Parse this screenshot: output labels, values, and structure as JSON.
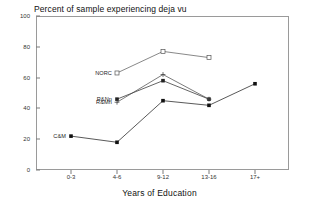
{
  "chart_data": {
    "type": "line",
    "title": "Percent of sample experiencing deja vu",
    "xlabel": "Years of Education",
    "ylabel": "",
    "categories": [
      "0-3",
      "4-6",
      "9-12",
      "13-16",
      "17+"
    ],
    "ylim": [
      0,
      100
    ],
    "yticks": [
      0,
      20,
      40,
      60,
      80,
      100
    ],
    "grid": false,
    "legend": "inline-labels",
    "series": [
      {
        "name": "NORC",
        "marker": "open-square",
        "color": "#555555",
        "points": [
          {
            "x": "4-6",
            "y": 63
          },
          {
            "x": "9-12",
            "y": 77
          },
          {
            "x": "13-16",
            "y": 73
          }
        ]
      },
      {
        "name": "R&Np",
        "marker": "filled-square",
        "color": "#222222",
        "points": [
          {
            "x": "4-6",
            "y": 46
          },
          {
            "x": "9-12",
            "y": 58
          },
          {
            "x": "13-16",
            "y": 46
          }
        ]
      },
      {
        "name": "R&Mn",
        "marker": "plus",
        "color": "#444444",
        "points": [
          {
            "x": "4-6",
            "y": 44
          },
          {
            "x": "9-12",
            "y": 62
          },
          {
            "x": "13-16",
            "y": 46
          }
        ]
      },
      {
        "name": "C&M",
        "marker": "filled-square",
        "color": "#111111",
        "points": [
          {
            "x": "0-3",
            "y": 22
          },
          {
            "x": "4-6",
            "y": 18
          },
          {
            "x": "9-12",
            "y": 45
          },
          {
            "x": "13-16",
            "y": 42
          },
          {
            "x": "17+",
            "y": 56
          }
        ]
      }
    ],
    "annotations": [
      {
        "text": "NORC",
        "series": "NORC"
      },
      {
        "text": "R&Np",
        "series": "R&Np"
      },
      {
        "text": "R&Mn",
        "series": "R&Mn"
      },
      {
        "text": "C&M",
        "series": "C&M"
      }
    ]
  }
}
